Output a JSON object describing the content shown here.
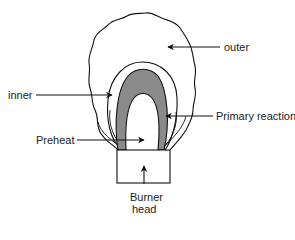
{
  "diagram": {
    "type": "flame-zone-diagram",
    "colors": {
      "line": "#111111",
      "primary_reaction_fill": "#8a8a8a",
      "background": "#ffffff"
    },
    "labels": {
      "outer": "outer",
      "inner": "inner",
      "primary_reaction": "Primary reaction",
      "preheat": "Preheat",
      "burner_line1": "Burner",
      "burner_line2": "head"
    },
    "zones": [
      {
        "id": "outer",
        "description": "outer flame envelope"
      },
      {
        "id": "inner",
        "description": "inner flame cone"
      },
      {
        "id": "primary_reaction",
        "description": "primary reaction zone (shaded)"
      },
      {
        "id": "preheat",
        "description": "preheat zone"
      },
      {
        "id": "burner_head",
        "description": "burner head"
      }
    ]
  }
}
